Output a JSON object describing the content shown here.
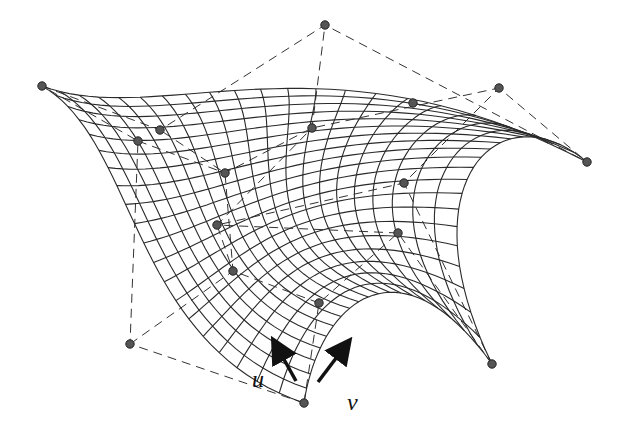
{
  "figure": {
    "type": "bezier-surface",
    "labels": {
      "u": "u",
      "v": "v"
    },
    "colors": {
      "mesh": "#2a2a2a",
      "net": "#333333",
      "point": "#555555",
      "background": "#ffffff"
    },
    "grid_divisions": 20,
    "control_points": [
      [
        [
          304,
          403
        ],
        [
          130,
          344
        ],
        [
          138,
          141
        ],
        [
          42,
          86
        ]
      ],
      [
        [
          319,
          303
        ],
        [
          233,
          271
        ],
        [
          225,
          173
        ],
        [
          160,
          130
        ]
      ],
      [
        [
          398,
          233
        ],
        [
          217,
          225
        ],
        [
          312,
          128
        ],
        [
          325,
          25
        ]
      ],
      [
        [
          492,
          364
        ],
        [
          404,
          183
        ],
        [
          499,
          88
        ],
        [
          587,
          162
        ]
      ]
    ],
    "extra_points": [
      [
        413,
        103
      ]
    ],
    "arrows": {
      "u": {
        "from": [
          296,
          381
        ],
        "to": [
          276,
          345
        ]
      },
      "v": {
        "from": [
          318,
          382
        ],
        "to": [
          346,
          345
        ]
      }
    }
  }
}
